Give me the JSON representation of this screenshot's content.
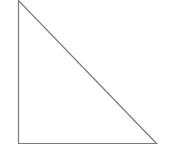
{
  "diagram": {
    "shape": "right-triangle",
    "stroke_color": "#7a7a7a",
    "fill_color": "#ffffff",
    "stroke_width": 1.2,
    "vertices": {
      "top": [
        18.5,
        0.5
      ],
      "bottom_left": [
        18.5,
        143.5
      ],
      "bottom_right": [
        156.5,
        143.5
      ]
    }
  }
}
